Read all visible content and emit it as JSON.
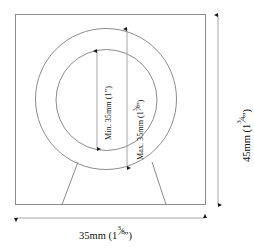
{
  "figure": {
    "type": "engineering-dimension-drawing",
    "line_color": "#8c8c8c",
    "arrow_color": "#1a1a1a",
    "background_color": "#ffffff"
  },
  "labels": {
    "min_diameter": {
      "prefix": "Min. 35mm (1",
      "inch_mark": "”",
      "suffix": ")",
      "full_text": "Min. 35mm (1”)",
      "value_mm": 35,
      "value_inch": "1”",
      "orientation": "vertical"
    },
    "max_diameter": {
      "prefix": "Max. 35mm (1",
      "fraction_numerator": "3",
      "fraction_slash": "⁄",
      "fraction_denominator": "8",
      "inch_mark": "”",
      "suffix": ")",
      "full_text": "Max. 35mm (1 3/8”)",
      "value_mm": 35,
      "value_inch": "1 3/8”",
      "orientation": "vertical"
    },
    "overall_height": {
      "prefix": "45mm (1",
      "fraction_numerator": "3",
      "fraction_slash": "⁄",
      "fraction_denominator": "4",
      "inch_mark": "”",
      "suffix": ")",
      "full_text": "45mm (1 3/4”)",
      "value_mm": 45,
      "value_inch": "1 3/4”",
      "orientation": "vertical"
    },
    "overall_width": {
      "prefix": "35mm (1",
      "fraction_numerator": "3",
      "fraction_slash": "⁄",
      "fraction_denominator": "8",
      "inch_mark": "”",
      "suffix": ")",
      "full_text": "35mm (1 3/8”)",
      "value_mm": 35,
      "value_inch": "1 3/8”",
      "orientation": "horizontal"
    }
  },
  "geometry": {
    "plate": {
      "x": 15,
      "y": 14,
      "width": 191,
      "height": 191
    },
    "outer_circle": {
      "cx": 106,
      "cy": 99,
      "r": 71
    },
    "inner_circle": {
      "cx": 106,
      "cy": 100,
      "r": 51
    },
    "stand_left": {
      "x1": 78,
      "y1": 162,
      "x2": 62,
      "y2": 205
    },
    "stand_right": {
      "x1": 152,
      "y1": 162,
      "x2": 166,
      "y2": 205
    },
    "min_dim_line": {
      "x": 97,
      "y1": 51,
      "y2": 149
    },
    "max_dim_line": {
      "x": 127,
      "y1": 29,
      "y2": 168
    },
    "height_dim_line": {
      "x": 218,
      "y1": 15,
      "y2": 205
    },
    "width_dim_line": {
      "y": 218,
      "x1": 15,
      "x2": 206
    }
  }
}
